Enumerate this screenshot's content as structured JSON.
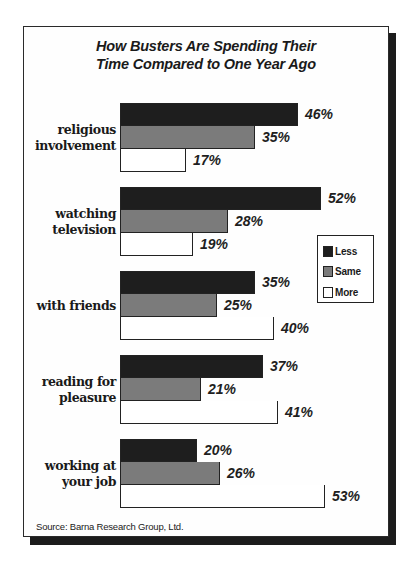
{
  "chart_data": {
    "type": "bar",
    "orientation": "horizontal",
    "title": "How Busters Are Spending Their Time Compared to One Year Ago",
    "title_lines": [
      "How Busters Are Spending Their",
      "Time Compared to One Year Ago"
    ],
    "categories": [
      "religious involvement",
      "watching television",
      "with friends",
      "reading for pleasure",
      "working at your job"
    ],
    "category_lines": [
      [
        "religious",
        "involvement"
      ],
      [
        "watching",
        "television"
      ],
      [
        "with friends"
      ],
      [
        "reading for",
        "pleasure"
      ],
      [
        "working at",
        "your job"
      ]
    ],
    "series": [
      {
        "name": "Less",
        "color": "#1e1e1e",
        "values": [
          46,
          52,
          35,
          37,
          20
        ]
      },
      {
        "name": "Same",
        "color": "#7b7b7b",
        "values": [
          35,
          28,
          25,
          21,
          26
        ]
      },
      {
        "name": "More",
        "color": "#ffffff",
        "values": [
          17,
          19,
          40,
          41,
          53
        ]
      }
    ],
    "value_format": "{v}%",
    "xlabel": "",
    "ylabel": "",
    "xlim": [
      0,
      60
    ],
    "grid": false,
    "legend_position": "right",
    "source": "Source: Barna Research Group, Ltd."
  },
  "labels": {
    "values": [
      [
        "46%",
        "35%",
        "17%"
      ],
      [
        "52%",
        "28%",
        "19%"
      ],
      [
        "35%",
        "25%",
        "40%"
      ],
      [
        "37%",
        "21%",
        "41%"
      ],
      [
        "20%",
        "26%",
        "53%"
      ]
    ]
  },
  "legend": {
    "items": [
      {
        "label": "Less",
        "color": "#1e1e1e"
      },
      {
        "label": "Same",
        "color": "#7b7b7b"
      },
      {
        "label": "More",
        "color": "#ffffff"
      }
    ]
  }
}
